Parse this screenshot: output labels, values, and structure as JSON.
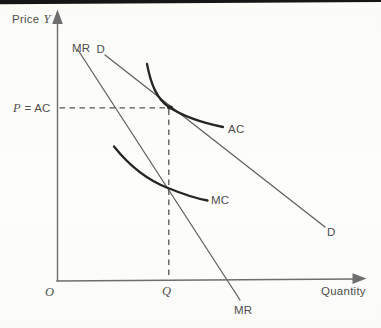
{
  "figure": {
    "type": "economics-curve-diagram",
    "description_rendered": "Demand and marginal revenue lines with tangent average cost curve and marginal cost curve",
    "background": "#fcfcfa",
    "top_rule_color": "#161616",
    "colors": {
      "axis": "#6e6e6e",
      "demand_mr_lines": "#5f5f5f",
      "cost_curves": "#262626",
      "dashed_guides": "#525252",
      "text": "#4e4e4e"
    },
    "axes": {
      "y_label_word": "Price",
      "y_label_var": "Y",
      "x_label": "Quantity",
      "origin_label": "O"
    },
    "equilibrium": {
      "price_var": "P",
      "price_rest": "= AC",
      "quantity_label": "Q"
    },
    "curve_labels": {
      "mr_top": "MR",
      "mr_bottom": "MR",
      "demand_top": "D",
      "demand_bottom": "D",
      "average_cost": "AC",
      "marginal_cost": "MC"
    }
  }
}
